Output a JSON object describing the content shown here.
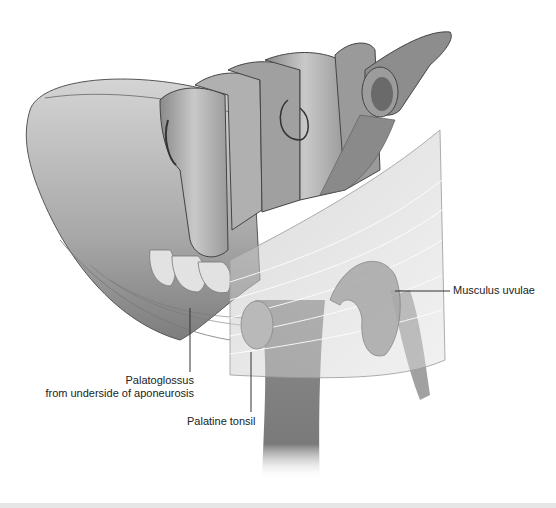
{
  "figure": {
    "colors": {
      "tissue_light": "#c8c8c8",
      "tissue_mid": "#9a9a9a",
      "tissue_dark": "#6e6e6e",
      "leader_line": "#333333",
      "label_text": "#222222",
      "footer_bar": "#e6e6e6"
    }
  },
  "labels": {
    "musculus_uvulae": "Musculus uvulae",
    "palatoglossus_line1": "Palatoglossus",
    "palatoglossus_line2": "from underside of aponeurosis",
    "palatine_tonsil": "Palatine tonsil"
  }
}
